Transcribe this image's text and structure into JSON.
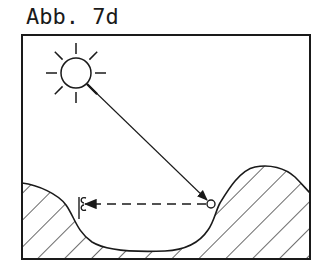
{
  "figure": {
    "label": "Abb. 7d",
    "frame": {
      "x": 22,
      "y": 35,
      "width": 288,
      "height": 224
    },
    "sun": {
      "cx": 76,
      "cy": 73,
      "r": 15,
      "ray_inner": 19,
      "ray_outer": 30,
      "ray_count": 8
    },
    "ball": {
      "cx": 211,
      "cy": 204,
      "r": 4
    },
    "observer": {
      "x": 81,
      "y": 206
    },
    "sun_ray": {
      "from": [
        88,
        84
      ],
      "to": [
        208,
        200
      ],
      "style": "solid-arrow"
    },
    "sight_line": {
      "from": [
        207,
        204
      ],
      "to": [
        84,
        204
      ],
      "style": "dashed-arrow"
    },
    "terrain": {
      "fill": "hatched",
      "hatch_angle_deg": 45
    },
    "colors": {
      "ink": "#1a1a1a",
      "background": "#ffffff"
    }
  }
}
